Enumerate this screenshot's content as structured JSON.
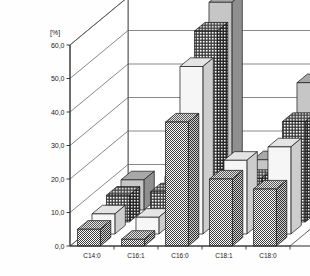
{
  "chart_data": {
    "type": "bar",
    "title": "",
    "subtitle": "",
    "xlabel": "",
    "ylabel": "[%]",
    "ylim": [
      0.0,
      60.0
    ],
    "ytick_labels": [
      "0,0",
      "10,0",
      "20,0",
      "30,0",
      "40,0",
      "50,0",
      "60,0"
    ],
    "ytick_values": [
      0,
      10,
      20,
      30,
      40,
      50,
      60
    ],
    "grid": true,
    "projection": "3d-oblique",
    "legend_position": "right-depth-axis",
    "depth_axis_labels": [
      "I",
      "II",
      "III",
      "IV"
    ],
    "categories": [
      "C14:0",
      "C16:1",
      "C16:0",
      "C18:1",
      "C18:0"
    ],
    "series": [
      {
        "name": "I",
        "fill": "light-gray-solid",
        "color": "#b4b4b4",
        "values": [
          9.0,
          10.0,
          62.0,
          15.0,
          38.0
        ]
      },
      {
        "name": "II",
        "fill": "dense-crosshatch",
        "color": "#6e6e6e",
        "values": [
          8.0,
          9.0,
          57.0,
          13.0,
          30.0
        ]
      },
      {
        "name": "III",
        "fill": "white-solid",
        "color": "#f2f2f2",
        "values": [
          6.0,
          5.0,
          50.0,
          22.0,
          26.0
        ]
      },
      {
        "name": "IV",
        "fill": "medium-checkered",
        "color": "#7a7a7a",
        "values": [
          5.0,
          2.0,
          37.0,
          20.0,
          17.0
        ]
      }
    ]
  },
  "axes": {
    "y_unit": "[%]"
  }
}
